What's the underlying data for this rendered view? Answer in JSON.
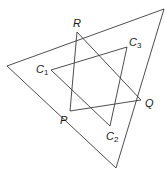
{
  "diagram": {
    "type": "geometry-triangles",
    "stroke_color": "#3a3a3a",
    "outer_triangle": {
      "vertices": [
        [
          7,
          66
        ],
        [
          164,
          9
        ],
        [
          116,
          168
        ]
      ]
    },
    "triangle_PQR": {
      "R": [
        77,
        32
      ],
      "P": [
        70,
        111
      ],
      "Q": [
        141,
        100
      ]
    },
    "triangle_C1C2C3": {
      "C1": [
        51,
        70
      ],
      "C2": [
        110,
        126
      ],
      "C3": [
        127,
        47
      ]
    },
    "labels": {
      "R": {
        "text": "R",
        "sub": "",
        "x": 73,
        "y": 27
      },
      "Q": {
        "text": "Q",
        "sub": "",
        "x": 145,
        "y": 107
      },
      "P": {
        "text": "P",
        "sub": "",
        "x": 60,
        "y": 124
      },
      "C1": {
        "text": "C",
        "sub": "1",
        "x": 36,
        "y": 73
      },
      "C2": {
        "text": "C",
        "sub": "2",
        "x": 106,
        "y": 140
      },
      "C3": {
        "text": "C",
        "sub": "3",
        "x": 129,
        "y": 46
      }
    }
  }
}
